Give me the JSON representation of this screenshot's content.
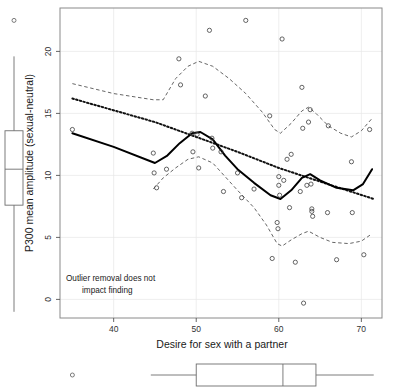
{
  "figure": {
    "kind": "scatter-with-marginal-boxplots",
    "annotation_line1": "Outlier removal does not",
    "annotation_line2": "impact finding"
  },
  "chart_data": {
    "type": "scatter",
    "title": "",
    "xlabel": "Desire for sex with a partner",
    "ylabel": "P300 mean amplitude (sexual-neutral)",
    "xlim": [
      33.5,
      72.5
    ],
    "ylim": [
      -1.5,
      23.5
    ],
    "xticks": [
      40,
      50,
      60,
      70
    ],
    "yticks": [
      0,
      5,
      10,
      15,
      20
    ],
    "grid": true,
    "legend": "none",
    "annotations": [
      {
        "text": "Outlier removal does not impact finding",
        "x": 36,
        "y": 0.9
      }
    ],
    "points": [
      {
        "x": 35.0,
        "y": 13.7
      },
      {
        "x": 44.8,
        "y": 11.8
      },
      {
        "x": 44.9,
        "y": 10.2
      },
      {
        "x": 45.2,
        "y": 9.0
      },
      {
        "x": 46.4,
        "y": 10.5
      },
      {
        "x": 47.9,
        "y": 19.4
      },
      {
        "x": 48.1,
        "y": 17.3
      },
      {
        "x": 49.5,
        "y": 13.4
      },
      {
        "x": 49.6,
        "y": 11.9
      },
      {
        "x": 50.1,
        "y": 13.3
      },
      {
        "x": 50.3,
        "y": 10.6
      },
      {
        "x": 51.1,
        "y": 16.4
      },
      {
        "x": 51.6,
        "y": 21.7
      },
      {
        "x": 51.9,
        "y": 13.0
      },
      {
        "x": 52.0,
        "y": 12.2
      },
      {
        "x": 53.0,
        "y": 11.9
      },
      {
        "x": 53.3,
        "y": 8.7
      },
      {
        "x": 55.0,
        "y": 10.2
      },
      {
        "x": 55.5,
        "y": 8.2
      },
      {
        "x": 56.0,
        "y": 22.5
      },
      {
        "x": 57.0,
        "y": 8.9
      },
      {
        "x": 58.9,
        "y": 14.8
      },
      {
        "x": 59.2,
        "y": 3.3
      },
      {
        "x": 59.8,
        "y": 6.2
      },
      {
        "x": 59.9,
        "y": 5.7
      },
      {
        "x": 60.0,
        "y": 9.9
      },
      {
        "x": 60.0,
        "y": 9.2
      },
      {
        "x": 60.1,
        "y": 8.4
      },
      {
        "x": 60.4,
        "y": 21.0
      },
      {
        "x": 60.6,
        "y": 9.6
      },
      {
        "x": 61.0,
        "y": 11.3
      },
      {
        "x": 61.3,
        "y": 7.4
      },
      {
        "x": 61.5,
        "y": 11.7
      },
      {
        "x": 62.0,
        "y": 3.0
      },
      {
        "x": 62.6,
        "y": 8.7
      },
      {
        "x": 62.8,
        "y": 17.1
      },
      {
        "x": 62.9,
        "y": 13.8
      },
      {
        "x": 63.0,
        "y": -0.3
      },
      {
        "x": 63.4,
        "y": 9.2
      },
      {
        "x": 63.6,
        "y": 14.3
      },
      {
        "x": 63.8,
        "y": 15.3
      },
      {
        "x": 63.9,
        "y": 9.3
      },
      {
        "x": 64.0,
        "y": 7.3
      },
      {
        "x": 64.0,
        "y": 7.1
      },
      {
        "x": 64.1,
        "y": 6.7
      },
      {
        "x": 65.9,
        "y": 7.0
      },
      {
        "x": 66.0,
        "y": 14.0
      },
      {
        "x": 67.0,
        "y": 3.2
      },
      {
        "x": 68.8,
        "y": 11.1
      },
      {
        "x": 68.9,
        "y": 7.0
      },
      {
        "x": 70.3,
        "y": 3.6
      },
      {
        "x": 71.0,
        "y": 13.7
      }
    ],
    "fit_linear": [
      {
        "x": 35.0,
        "y": 16.2
      },
      {
        "x": 45.0,
        "y": 14.3
      },
      {
        "x": 50.0,
        "y": 13.1
      },
      {
        "x": 55.0,
        "y": 11.9
      },
      {
        "x": 60.0,
        "y": 10.6
      },
      {
        "x": 65.0,
        "y": 9.5
      },
      {
        "x": 71.5,
        "y": 8.1
      }
    ],
    "fit_loess": [
      {
        "x": 35.0,
        "y": 13.4
      },
      {
        "x": 40.0,
        "y": 12.3
      },
      {
        "x": 45.0,
        "y": 11.0
      },
      {
        "x": 46.5,
        "y": 11.6
      },
      {
        "x": 48.0,
        "y": 12.6
      },
      {
        "x": 49.5,
        "y": 13.4
      },
      {
        "x": 50.5,
        "y": 13.5
      },
      {
        "x": 52.0,
        "y": 12.9
      },
      {
        "x": 53.5,
        "y": 11.6
      },
      {
        "x": 55.0,
        "y": 10.5
      },
      {
        "x": 57.0,
        "y": 9.4
      },
      {
        "x": 59.0,
        "y": 8.4
      },
      {
        "x": 60.2,
        "y": 8.1
      },
      {
        "x": 61.5,
        "y": 8.8
      },
      {
        "x": 62.8,
        "y": 9.8
      },
      {
        "x": 63.8,
        "y": 10.1
      },
      {
        "x": 65.0,
        "y": 9.6
      },
      {
        "x": 67.0,
        "y": 9.0
      },
      {
        "x": 69.0,
        "y": 8.8
      },
      {
        "x": 70.2,
        "y": 9.3
      },
      {
        "x": 71.3,
        "y": 10.5
      }
    ],
    "band_upper": [
      {
        "x": 35.0,
        "y": 17.4
      },
      {
        "x": 40.0,
        "y": 16.6
      },
      {
        "x": 44.8,
        "y": 16.1
      },
      {
        "x": 46.0,
        "y": 16.1
      },
      {
        "x": 47.5,
        "y": 17.8
      },
      {
        "x": 49.0,
        "y": 18.8
      },
      {
        "x": 50.3,
        "y": 19.2
      },
      {
        "x": 52.0,
        "y": 18.8
      },
      {
        "x": 54.0,
        "y": 17.8
      },
      {
        "x": 56.0,
        "y": 16.6
      },
      {
        "x": 58.0,
        "y": 15.1
      },
      {
        "x": 59.5,
        "y": 13.7
      },
      {
        "x": 60.2,
        "y": 13.4
      },
      {
        "x": 61.5,
        "y": 14.2
      },
      {
        "x": 62.8,
        "y": 15.2
      },
      {
        "x": 63.6,
        "y": 15.5
      },
      {
        "x": 64.5,
        "y": 15.0
      },
      {
        "x": 66.0,
        "y": 14.0
      },
      {
        "x": 67.5,
        "y": 13.4
      },
      {
        "x": 68.8,
        "y": 13.1
      },
      {
        "x": 70.0,
        "y": 13.6
      },
      {
        "x": 71.3,
        "y": 14.6
      }
    ],
    "band_lower": [
      {
        "x": 44.8,
        "y": 8.9
      },
      {
        "x": 46.0,
        "y": 9.8
      },
      {
        "x": 47.5,
        "y": 10.6
      },
      {
        "x": 49.0,
        "y": 11.3
      },
      {
        "x": 50.3,
        "y": 11.5
      },
      {
        "x": 52.0,
        "y": 11.0
      },
      {
        "x": 53.5,
        "y": 9.9
      },
      {
        "x": 55.0,
        "y": 8.8
      },
      {
        "x": 57.0,
        "y": 7.4
      },
      {
        "x": 58.5,
        "y": 6.0
      },
      {
        "x": 59.8,
        "y": 4.5
      },
      {
        "x": 60.4,
        "y": 4.3
      },
      {
        "x": 61.5,
        "y": 4.8
      },
      {
        "x": 62.8,
        "y": 5.3
      },
      {
        "x": 63.6,
        "y": 5.5
      },
      {
        "x": 65.0,
        "y": 5.0
      },
      {
        "x": 66.5,
        "y": 4.6
      },
      {
        "x": 68.5,
        "y": 4.5
      },
      {
        "x": 70.0,
        "y": 4.7
      },
      {
        "x": 71.3,
        "y": 5.3
      }
    ],
    "boxplot_y": {
      "orientation": "vertical",
      "min_whisker": -1.0,
      "q1": 7.6,
      "median": 10.5,
      "q3": 13.6,
      "max_whisker": 19.6,
      "outliers": [
        22.5
      ]
    },
    "boxplot_x": {
      "orientation": "horizontal",
      "min_whisker": 44.5,
      "q1": 50.0,
      "median": 60.5,
      "q3": 64.5,
      "max_whisker": 71.5,
      "outliers": [
        35.0
      ]
    }
  }
}
